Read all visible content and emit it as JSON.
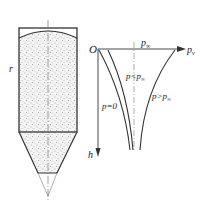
{
  "figure": {
    "silo": {
      "label_r": "r",
      "fill_pattern": "stippled granular material"
    },
    "pressure_diagram": {
      "origin_label": "O",
      "x_axis_label": "p",
      "x_axis_subscript": "v",
      "y_axis_label": "h",
      "asymptote_label": "p",
      "asymptote_subscript": "∞",
      "curves": [
        {
          "label": "p=0",
          "sub": ""
        },
        {
          "label": "p<p",
          "sub": "∞"
        },
        {
          "label": "p>p",
          "sub": "∞"
        }
      ]
    }
  }
}
